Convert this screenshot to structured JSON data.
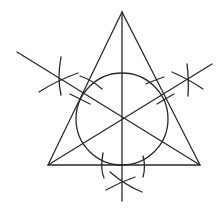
{
  "diagram": {
    "stroke_color": "#2a2a2a",
    "background": "#ffffff",
    "triangle": {
      "apex": [
        122,
        12
      ],
      "bottom_left": [
        48,
        165
      ],
      "bottom_right": [
        200,
        165
      ]
    },
    "incircle": {
      "center": [
        122,
        118
      ],
      "radius": 46
    },
    "bisectors": [
      {
        "name": "vertical",
        "from": [
          122,
          12
        ],
        "to": [
          122,
          201
        ]
      },
      {
        "name": "left",
        "from": [
          17,
          52
        ],
        "to": [
          200,
          165
        ]
      },
      {
        "name": "right",
        "from": [
          212,
          64
        ],
        "to": [
          48,
          165
        ]
      }
    ],
    "construction_marks": [
      {
        "name": "left-star",
        "center": [
          60,
          79
        ]
      },
      {
        "name": "right-star",
        "center": [
          188,
          79
        ]
      },
      {
        "name": "bottom-star",
        "center": [
          122,
          182
        ]
      }
    ]
  }
}
